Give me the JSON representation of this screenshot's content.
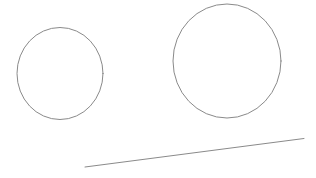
{
  "canvas": {
    "name": "drawing-canvas",
    "width": 316,
    "height": 178,
    "background_color": "#ffffff",
    "title": ""
  },
  "style": {
    "stroke_color": "#8a8a8a",
    "line_stroke_color": "#8a8a8a",
    "stroke_width": 1,
    "fill": "none"
  },
  "shapes": [
    {
      "id": "ellipse-left",
      "type": "ellipse",
      "label": "small circle",
      "cx": 60,
      "cy": 73.5,
      "rx": 43,
      "ry": 46,
      "stroke": "#8a8a8a",
      "stroke_width": 1,
      "fill": "none"
    },
    {
      "id": "ellipse-right",
      "type": "ellipse",
      "label": "large circle",
      "cx": 227,
      "cy": 61,
      "rx": 54,
      "ry": 57,
      "stroke": "#8a8a8a",
      "stroke_width": 1,
      "fill": "none"
    },
    {
      "id": "line-diagonal",
      "type": "line",
      "label": "diagonal line",
      "x1": 85,
      "y1": 167,
      "x2": 304,
      "y2": 138.5,
      "stroke": "#8a8a8a",
      "stroke_width": 1
    }
  ]
}
